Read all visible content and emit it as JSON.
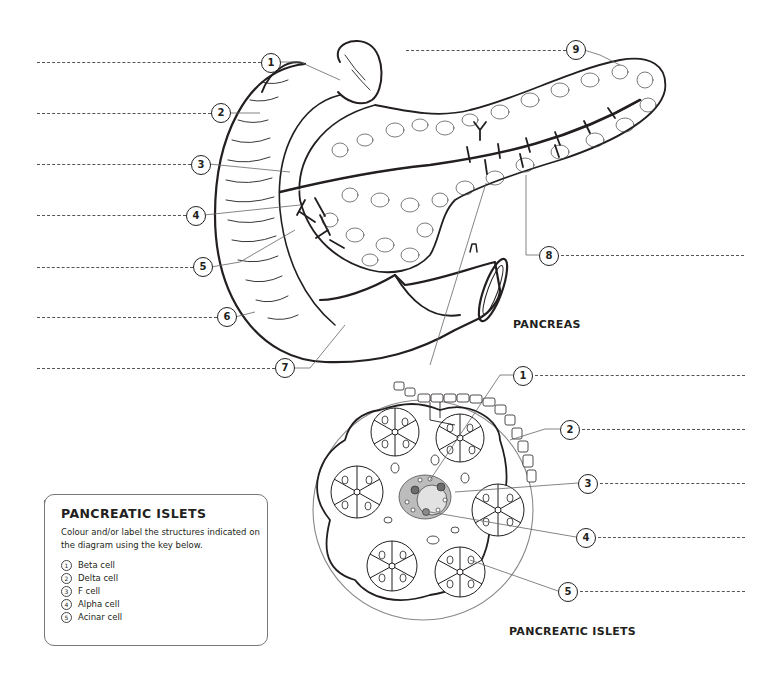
{
  "pancreas": {
    "title": "PANCREAS",
    "callouts": [
      {
        "n": "1",
        "x": 261,
        "y": 53,
        "line_x1": 37,
        "line_x2": 261,
        "line_y": 62
      },
      {
        "n": "2",
        "x": 211,
        "y": 103,
        "line_x1": 37,
        "line_x2": 211,
        "line_y": 113
      },
      {
        "n": "3",
        "x": 191,
        "y": 155,
        "line_x1": 37,
        "line_x2": 191,
        "line_y": 164
      },
      {
        "n": "4",
        "x": 186,
        "y": 206,
        "line_x1": 37,
        "line_x2": 186,
        "line_y": 215
      },
      {
        "n": "5",
        "x": 193,
        "y": 257,
        "line_x1": 37,
        "line_x2": 193,
        "line_y": 267
      },
      {
        "n": "6",
        "x": 217,
        "y": 307,
        "line_x1": 37,
        "line_x2": 217,
        "line_y": 317
      },
      {
        "n": "7",
        "x": 275,
        "y": 358,
        "line_x1": 37,
        "line_x2": 275,
        "line_y": 368
      },
      {
        "n": "8",
        "x": 539,
        "y": 246,
        "line_x1": 559,
        "line_x2": 742,
        "line_y": 255
      },
      {
        "n": "9",
        "x": 566,
        "y": 40,
        "line_x1": 406,
        "line_x2": 566,
        "line_y": 50
      }
    ]
  },
  "islets": {
    "title": "PANCREATIC ISLETS",
    "callouts": [
      {
        "n": "1",
        "x": 513,
        "y": 366,
        "line_x1": 533,
        "line_x2": 745,
        "line_y": 375
      },
      {
        "n": "2",
        "x": 560,
        "y": 420,
        "line_x1": 580,
        "line_x2": 745,
        "line_y": 429
      },
      {
        "n": "3",
        "x": 578,
        "y": 474,
        "line_x1": 598,
        "line_x2": 745,
        "line_y": 483
      },
      {
        "n": "4",
        "x": 576,
        "y": 528,
        "line_x1": 596,
        "line_x2": 745,
        "line_y": 537
      },
      {
        "n": "5",
        "x": 558,
        "y": 582,
        "line_x1": 578,
        "line_x2": 745,
        "line_y": 591
      }
    ]
  },
  "key": {
    "heading": "PANCREATIC ISLETS",
    "instructions": "Colour and/or label the structures indicated on the diagram using the key below.",
    "items": [
      {
        "n": "1",
        "label": "Beta cell"
      },
      {
        "n": "2",
        "label": "Delta cell"
      },
      {
        "n": "3",
        "label": "F cell"
      },
      {
        "n": "4",
        "label": "Alpha cell"
      },
      {
        "n": "5",
        "label": "Acinar cell"
      }
    ]
  },
  "colors": {
    "ink": "#231f20",
    "leader": "#555555",
    "islet_dark": "#6d6d6d",
    "islet_mid": "#a8a8a8",
    "islet_light": "#d4d4d4"
  }
}
